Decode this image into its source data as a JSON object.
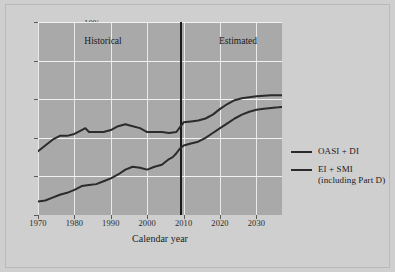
{
  "chart_data": {
    "type": "line",
    "title": "",
    "xlabel": "Calendar year",
    "ylabel": "",
    "xlim": [
      1970,
      2037
    ],
    "ylim": [
      0,
      10
    ],
    "grid": true,
    "xticks": [
      "1970",
      "1980",
      "1990",
      "2000",
      "2010",
      "2020",
      "2030"
    ],
    "xtick_values": [
      1970,
      1980,
      1990,
      2000,
      2010,
      2020,
      2030
    ],
    "yticks": [
      "0%",
      "2%",
      "4%",
      "6%",
      "8%",
      "10%"
    ],
    "ytick_values": [
      0,
      2,
      4,
      6,
      8,
      10
    ],
    "annotations": [
      {
        "text": "Historical",
        "x": 1988,
        "y": 9.1
      },
      {
        "text": "Estimated",
        "x": 2020,
        "y": 9.1
      }
    ],
    "divider_x": 2009,
    "legend_position": "right",
    "series": [
      {
        "name": "OASI + DI",
        "color": "#2b2b2b",
        "x": [
          1970,
          1972,
          1974,
          1976,
          1978,
          1980,
          1982,
          1983,
          1984,
          1986,
          1988,
          1990,
          1992,
          1994,
          1995,
          1996,
          1998,
          2000,
          2002,
          2004,
          2006,
          2008,
          2009,
          2010,
          2012,
          2014,
          2016,
          2018,
          2020,
          2022,
          2024,
          2026,
          2028,
          2030,
          2032,
          2034,
          2036,
          2037
        ],
        "values": [
          3.3,
          3.6,
          3.9,
          4.1,
          4.1,
          4.2,
          4.4,
          4.5,
          4.3,
          4.3,
          4.3,
          4.4,
          4.6,
          4.7,
          4.65,
          4.6,
          4.5,
          4.3,
          4.3,
          4.3,
          4.25,
          4.3,
          4.55,
          4.8,
          4.85,
          4.9,
          5.0,
          5.2,
          5.5,
          5.75,
          5.95,
          6.05,
          6.1,
          6.15,
          6.18,
          6.2,
          6.2,
          6.2
        ]
      },
      {
        "name": "EI + SMI (including Part D)",
        "color": "#2b2b2b",
        "x": [
          1970,
          1972,
          1974,
          1976,
          1978,
          1980,
          1982,
          1984,
          1986,
          1988,
          1990,
          1992,
          1994,
          1996,
          1998,
          2000,
          2002,
          2004,
          2006,
          2007,
          2008,
          2009,
          2010,
          2012,
          2014,
          2016,
          2018,
          2020,
          2022,
          2024,
          2026,
          2028,
          2030,
          2032,
          2034,
          2036,
          2037
        ],
        "values": [
          0.7,
          0.75,
          0.9,
          1.05,
          1.15,
          1.3,
          1.5,
          1.55,
          1.6,
          1.75,
          1.9,
          2.1,
          2.35,
          2.5,
          2.45,
          2.35,
          2.5,
          2.6,
          2.9,
          3.0,
          3.2,
          3.45,
          3.6,
          3.7,
          3.8,
          4.0,
          4.25,
          4.5,
          4.75,
          5.0,
          5.2,
          5.35,
          5.45,
          5.5,
          5.55,
          5.58,
          5.6
        ]
      }
    ]
  },
  "legend": {
    "items": [
      {
        "label": "OASI + DI",
        "sublabel": ""
      },
      {
        "label": "EI + SMI",
        "sublabel": "(including Part D)"
      }
    ]
  }
}
